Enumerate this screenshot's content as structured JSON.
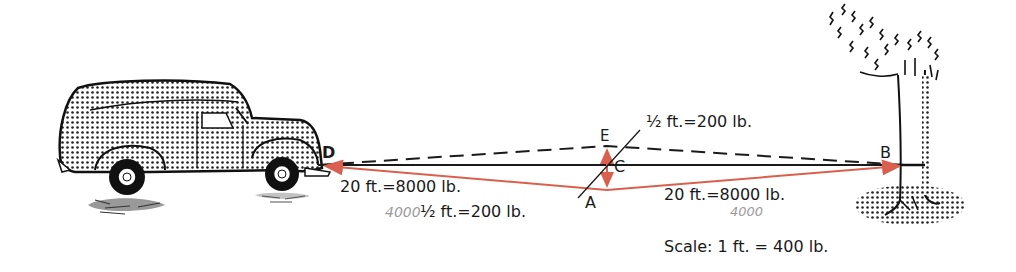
{
  "diagram": {
    "points": {
      "D": "D",
      "E": "E",
      "C": "C",
      "A": "A",
      "B": "B"
    },
    "labels": {
      "top_half": "½ ft.=200 lb.",
      "left_vector": "20 ft.=8000 lb.",
      "bottom_half": "½ ft.=200 lb.",
      "right_vector": "20 ft.=8000 lb.",
      "scale": "Scale:  1  ft. = 400 lb."
    },
    "handwritten": {
      "left": "4000",
      "right": "4000"
    },
    "objects": {
      "vehicle": "panel-truck",
      "anchor": "tree"
    },
    "colors": {
      "vector": "#d9604e",
      "line": "#1a1a1a",
      "dashed": "#1a1a1a"
    }
  }
}
